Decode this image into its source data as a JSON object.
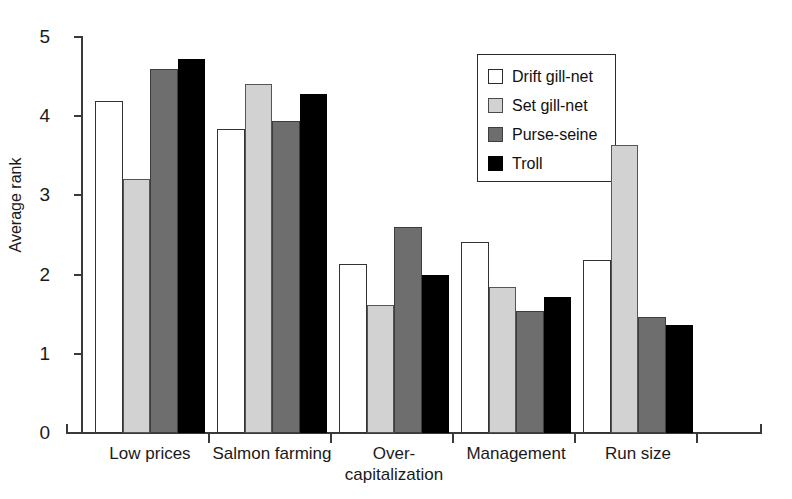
{
  "chart_data": {
    "type": "bar",
    "title": "",
    "xlabel": "",
    "ylabel": "Average rank",
    "ylim": [
      0,
      5
    ],
    "ytick_labels": [
      "0",
      "1",
      "2",
      "3",
      "4",
      "5"
    ],
    "ytick_values": [
      0,
      1,
      2,
      3,
      4,
      5
    ],
    "grid": false,
    "legend_position": "upper-right-inside",
    "categories": [
      "Low prices",
      "Salmon farming",
      "Over-\ncapitalization",
      "Management",
      "Run size"
    ],
    "category_labels": [
      "Low prices",
      "Salmon farming",
      "Over- capitalization",
      "Management",
      "Run size"
    ],
    "series": [
      {
        "name": "Drift gill-net",
        "color": "#ffffff",
        "values": [
          4.19,
          3.84,
          2.14,
          2.41,
          2.18
        ]
      },
      {
        "name": "Set gill-net",
        "color": "#d2d2d2",
        "values": [
          3.21,
          4.41,
          1.62,
          1.84,
          3.64
        ]
      },
      {
        "name": "Purse-seine",
        "color": "#6e6e6e",
        "values": [
          4.59,
          3.94,
          2.6,
          1.54,
          1.47
        ]
      },
      {
        "name": "Troll",
        "color": "#000000",
        "values": [
          4.72,
          4.28,
          1.99,
          1.72,
          1.36
        ]
      }
    ]
  },
  "legend": {
    "items": [
      {
        "label": "Drift gill-net"
      },
      {
        "label": "Set gill-net"
      },
      {
        "label": "Purse-seine"
      },
      {
        "label": "Troll"
      }
    ]
  },
  "axes": {
    "y_title": "Average rank",
    "y_ticks": [
      "5",
      "4",
      "3",
      "2",
      "1",
      "0"
    ],
    "x_categories": [
      {
        "line1": "Low prices",
        "line2": ""
      },
      {
        "line1": "Salmon farming",
        "line2": ""
      },
      {
        "line1": "Over-",
        "line2": "capitalization"
      },
      {
        "line1": "Management",
        "line2": ""
      },
      {
        "line1": "Run size",
        "line2": ""
      }
    ]
  }
}
